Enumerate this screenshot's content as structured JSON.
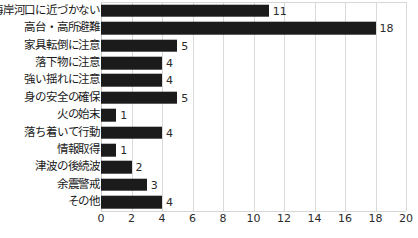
{
  "chart_data": {
    "type": "bar",
    "orientation": "horizontal",
    "title": "",
    "subtitle": "",
    "xlabel": "",
    "ylabel": "",
    "xlim": [
      0,
      20
    ],
    "xticks": [
      "0",
      "2",
      "4",
      "6",
      "8",
      "10",
      "12",
      "14",
      "16",
      "18",
      "20"
    ],
    "xtick_values": [
      0,
      2,
      4,
      6,
      8,
      10,
      12,
      14,
      16,
      18,
      20
    ],
    "grid": "vertical",
    "legend": "none",
    "bar_color": "#1b1b1b",
    "gridline_color": "#d9d9d9",
    "background_color": "#ffffff",
    "categories": [
      "海岸河口に近づかない",
      "高台・高所避難",
      "家具転倒に注意",
      "落下物に注意",
      "強い揺れに注意",
      "身の安全の確保",
      "火の始末",
      "落ち着いて行動",
      "情報取得",
      "津波の後続波",
      "余震警戒",
      "その他"
    ],
    "values": [
      11,
      18,
      5,
      4,
      4,
      5,
      1,
      4,
      1,
      2,
      3,
      4
    ],
    "data_labels": [
      "11",
      "18",
      "5",
      "4",
      "4",
      "5",
      "1",
      "4",
      "1",
      "2",
      "3",
      "4"
    ]
  }
}
